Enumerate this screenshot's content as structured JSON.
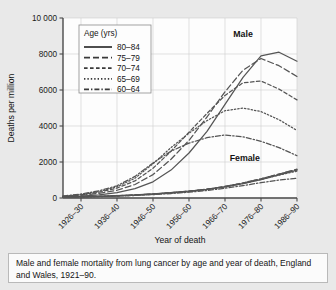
{
  "figure": {
    "caption": "Male and female mortality from lung cancer by age and year of death, England and Wales, 1921–90."
  },
  "legend": {
    "title": "Age (yrs)",
    "entries": [
      {
        "label": "80–84",
        "style": "solid"
      },
      {
        "label": "75–79",
        "style": "long-dash"
      },
      {
        "label": "70–74",
        "style": "medium-dash"
      },
      {
        "label": "65–69",
        "style": "dotted"
      },
      {
        "label": "60–64",
        "style": "dash-dot"
      }
    ]
  },
  "chart_data": {
    "type": "line",
    "title": "",
    "xlabel": "Year of death",
    "ylabel": "Deaths per million",
    "grid": true,
    "legend_position": "top-left-inside",
    "ylim": [
      0,
      10000
    ],
    "yticks": [
      0,
      2000,
      4000,
      6000,
      8000,
      10000
    ],
    "ytick_labels": [
      "0",
      "2000",
      "4000",
      "6000",
      "8000",
      "10 000"
    ],
    "categories": [
      "1921–25",
      "1926–30",
      "1931–35",
      "1936–40",
      "1941–45",
      "1946–50",
      "1951–55",
      "1956–60",
      "1961–65",
      "1966–70",
      "1971–75",
      "1976–80",
      "1981–85",
      "1986–90"
    ],
    "xtick_labels": [
      "1926–30",
      "1936–40",
      "1946–50",
      "1956–60",
      "1966–70",
      "1976–80",
      "1986–90"
    ],
    "xtick_indices": [
      1,
      3,
      5,
      7,
      9,
      11,
      13
    ],
    "annotations": [
      {
        "text": "Male",
        "x_index": 10.0,
        "y": 8950
      },
      {
        "text": "Female",
        "x_index": 10.1,
        "y": 2050
      }
    ],
    "series": [
      {
        "name": "Male 80–84",
        "sex": "Male",
        "age": "80–84",
        "style": "solid",
        "values": [
          60,
          110,
          180,
          300,
          520,
          900,
          1550,
          2500,
          3700,
          5200,
          6700,
          7900,
          8100,
          7600
        ]
      },
      {
        "name": "Male 75–79",
        "sex": "Male",
        "age": "75–79",
        "style": "long-dash",
        "values": [
          80,
          150,
          260,
          430,
          750,
          1300,
          2150,
          3200,
          4500,
          5900,
          7100,
          7750,
          7350,
          6750
        ]
      },
      {
        "name": "Male 70–74",
        "sex": "Male",
        "age": "70–74",
        "style": "medium-dash",
        "values": [
          90,
          180,
          320,
          550,
          950,
          1650,
          2600,
          3650,
          4700,
          5700,
          6400,
          6500,
          6050,
          5450
        ]
      },
      {
        "name": "Male 65–69",
        "sex": "Male",
        "age": "65–69",
        "style": "dotted",
        "values": [
          100,
          200,
          360,
          620,
          1100,
          1900,
          2800,
          3600,
          4300,
          4850,
          5000,
          4800,
          4350,
          3750
        ]
      },
      {
        "name": "Male 60–64",
        "sex": "Male",
        "age": "60–64",
        "style": "dash-dot",
        "values": [
          110,
          220,
          400,
          680,
          1200,
          1950,
          2600,
          3050,
          3350,
          3500,
          3400,
          3150,
          2800,
          2350
        ]
      },
      {
        "name": "Female 80–84",
        "sex": "Female",
        "age": "80–84",
        "style": "solid",
        "values": [
          55,
          70,
          95,
          130,
          175,
          230,
          300,
          380,
          480,
          620,
          800,
          1020,
          1280,
          1550
        ]
      },
      {
        "name": "Female 75–79",
        "sex": "Female",
        "age": "75–79",
        "style": "long-dash",
        "values": [
          50,
          68,
          92,
          125,
          170,
          225,
          295,
          380,
          490,
          640,
          830,
          1060,
          1330,
          1600
        ]
      },
      {
        "name": "Female 70–74",
        "sex": "Female",
        "age": "70–74",
        "style": "medium-dash",
        "values": [
          48,
          65,
          88,
          120,
          165,
          220,
          290,
          375,
          490,
          645,
          840,
          1070,
          1330,
          1580
        ]
      },
      {
        "name": "Female 65–69",
        "sex": "Female",
        "age": "65–69",
        "style": "dotted",
        "values": [
          45,
          60,
          82,
          112,
          152,
          205,
          272,
          355,
          465,
          615,
          805,
          1030,
          1270,
          1490
        ]
      },
      {
        "name": "Female 60–64",
        "sex": "Female",
        "age": "60–64",
        "style": "dash-dot",
        "values": [
          42,
          56,
          76,
          104,
          140,
          188,
          248,
          322,
          415,
          540,
          690,
          850,
          1000,
          1100
        ]
      }
    ]
  }
}
